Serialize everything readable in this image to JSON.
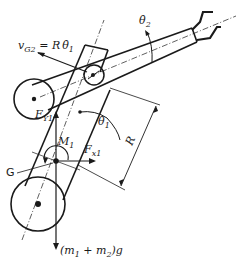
{
  "figure": {
    "colors": {
      "ink": "#1a1a1a",
      "background": "#ffffff"
    },
    "labels": {
      "vg2_main": "v",
      "vg2_sub": "G2",
      "vg2_rhs": " = R",
      "vg2_theta": "θ̇",
      "vg2_theta_sub": "1",
      "theta2_dot": "θ̇",
      "theta2_sub": "2",
      "theta1_dot": "θ̇",
      "theta1_sub": "1",
      "fy1_main": "F",
      "fy1_sub": "Y1",
      "fx1_main": "F",
      "fx1_sub": "x1",
      "m1_main": "M",
      "m1_sub": "1",
      "g_label": "G",
      "r_label": "R",
      "weight_label": "(m",
      "weight_sub1": "1",
      "weight_mid": " + m",
      "weight_sub2": "2",
      "weight_end": ")g"
    }
  }
}
